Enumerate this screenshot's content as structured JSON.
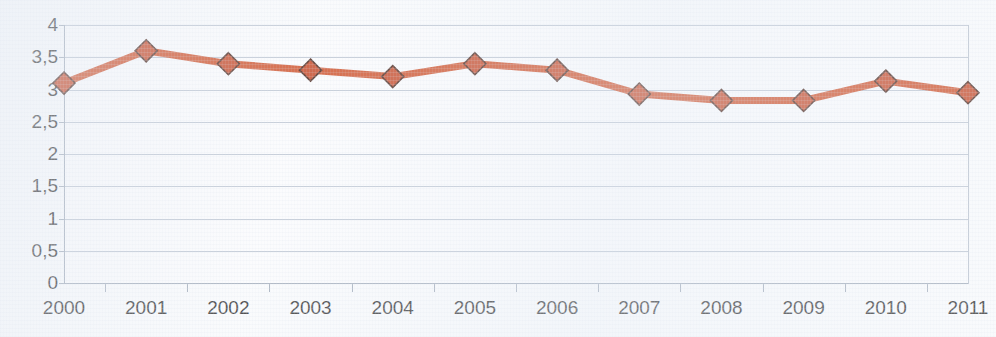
{
  "chart_data": {
    "type": "line",
    "title": "",
    "title_clipped": true,
    "subtitle": "",
    "xlabel": "",
    "ylabel": "",
    "categories": [
      "2000",
      "2001",
      "2002",
      "2003",
      "2004",
      "2005",
      "2006",
      "2007",
      "2008",
      "2009",
      "2010",
      "2011"
    ],
    "values": [
      3.1,
      3.6,
      3.4,
      3.3,
      3.2,
      3.4,
      3.3,
      2.93,
      2.83,
      2.83,
      3.13,
      2.95
    ],
    "series": [
      {
        "name": "",
        "values": [
          3.1,
          3.6,
          3.4,
          3.3,
          3.2,
          3.4,
          3.3,
          2.93,
          2.83,
          2.83,
          3.13,
          2.95
        ],
        "color": "#cc4318",
        "marker": "diamond",
        "marker_color": "#c23a15",
        "marker_edge_color": "#3b1408"
      }
    ],
    "ylim": [
      0,
      4
    ],
    "ytick_values": [
      0,
      0.5,
      1,
      1.5,
      2,
      2.5,
      3,
      3.5,
      4
    ],
    "ytick_labels": [
      "0",
      "0,5",
      "1",
      "1,5",
      "2",
      "2,5",
      "3",
      "3,5",
      "4"
    ],
    "xtick_labels": [
      "2000",
      "2001",
      "2002",
      "2003",
      "2004",
      "2005",
      "2006",
      "2007",
      "2008",
      "2009",
      "2010",
      "2011"
    ],
    "grid": true,
    "grid_axis": "y",
    "legend": false,
    "legend_position": "none",
    "decimal_separator": ",",
    "annotations": []
  },
  "figure": {
    "background_color": "#fbfcfd",
    "plot_background_color": "#fdfdfe",
    "gridline_color": "#b9c2cf",
    "axis_color": "#9aa5b4",
    "tick_label_color": "#1d1d1d",
    "line_color": "#cc4318",
    "marker_fill_color": "#c23a15",
    "marker_edge_color": "#3b1408"
  }
}
